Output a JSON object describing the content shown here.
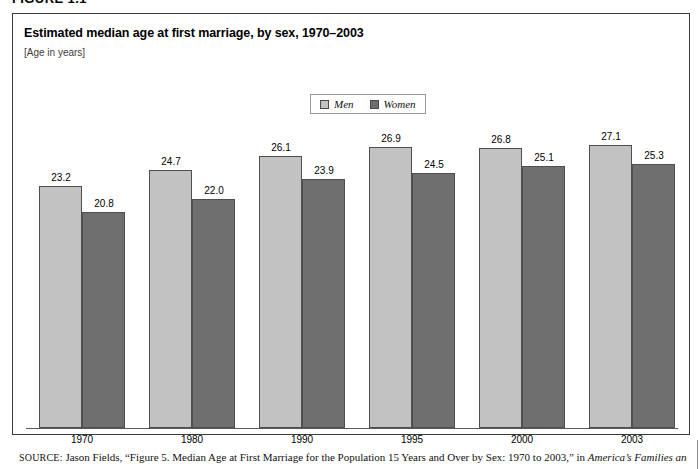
{
  "figure": {
    "label": "FIGURE 1.1"
  },
  "chart_data": {
    "type": "bar",
    "title": "Estimated median age at first marriage, by sex, 1970–2003",
    "subtitle": "[Age in years]",
    "xlabel": "",
    "ylabel": "Age in years",
    "ylim": [
      0,
      30
    ],
    "grid": false,
    "legend_position": "top-center",
    "categories": [
      "1970",
      "1980",
      "1990",
      "1995",
      "2000",
      "2003"
    ],
    "series": [
      {
        "name": "Men",
        "color": "#c2c2c2",
        "values": [
          23.2,
          24.7,
          26.1,
          26.9,
          26.8,
          27.1
        ]
      },
      {
        "name": "Women",
        "color": "#6f6f6f",
        "values": [
          20.8,
          22.0,
          23.9,
          24.5,
          25.1,
          25.3
        ]
      }
    ]
  },
  "legend": {
    "items": [
      {
        "label": "Men",
        "swatch": "#c2c2c2"
      },
      {
        "label": "Women",
        "swatch": "#6f6f6f"
      }
    ]
  },
  "source": {
    "prefix": "SOURCE:",
    "text_before_italic": " Jason Fields, “Figure 5. Median Age at First Marriage for the Population 15 Years and Over by Sex: 1970 to 2003,” in ",
    "italic_text": "America’s Families and"
  }
}
